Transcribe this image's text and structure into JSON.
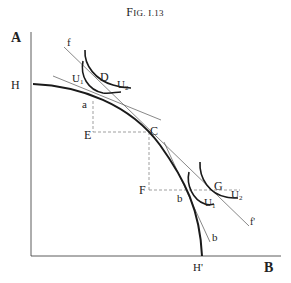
{
  "figure": {
    "title": "Fig. I.13",
    "title_prefix": "F",
    "title_rest": "IG. I.13"
  },
  "axes": {
    "y_label": "A",
    "x_label": "B"
  },
  "curves": {
    "transformation": {
      "start_label": "H",
      "end_label": "H'"
    },
    "tangent_line_f": {
      "start_label": "f",
      "end_label": "f'"
    },
    "tangent_line_b": {
      "label": "b"
    }
  },
  "points": {
    "a": "a",
    "C": "C",
    "b": "b",
    "D": "D",
    "G": "G",
    "E": "E",
    "F": "F"
  },
  "indifference": {
    "upper_left": {
      "u1": "U",
      "u1_sub": "1",
      "u2": "U",
      "u2_sub": "2"
    },
    "lower_right": {
      "u1": "U",
      "u1_sub": "1",
      "u2": "U",
      "u2_sub": "2"
    }
  },
  "colors": {
    "ink": "#222222",
    "thin_line": "#555555",
    "dashed": "#777777"
  }
}
